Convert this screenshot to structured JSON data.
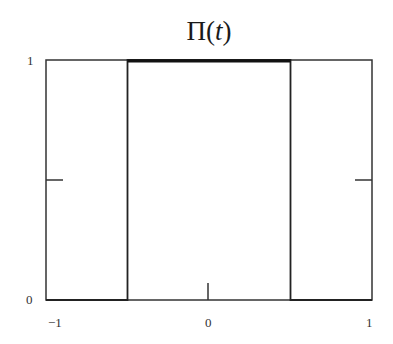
{
  "chart_data": {
    "type": "line",
    "title": "Π(t)",
    "title_parts": {
      "func": "Π(",
      "arg": "t",
      "close": ")"
    },
    "xlabel": "",
    "ylabel": "",
    "xlim": [
      -1,
      1
    ],
    "ylim": [
      0,
      1
    ],
    "grid": false,
    "legend": null,
    "x_tick_labels": [
      "−1",
      "0",
      "1"
    ],
    "y_tick_labels": [
      "0",
      "1"
    ],
    "series": [
      {
        "name": "Π(t)",
        "x": [
          -1,
          -0.5,
          -0.5,
          0.5,
          0.5,
          1
        ],
        "y": [
          0,
          0,
          1,
          1,
          0,
          0
        ]
      }
    ],
    "minor_ticks": {
      "y_mid": 0.5,
      "x_mid": 0
    }
  },
  "ui": {
    "line_color": "#222222",
    "pulse_top_color": "#111111"
  }
}
